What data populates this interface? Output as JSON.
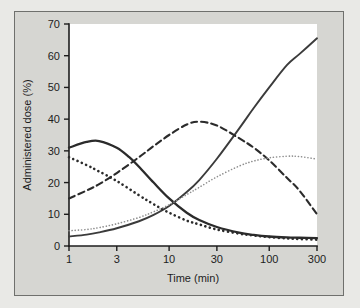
{
  "chart_data": {
    "type": "line",
    "title": "",
    "xlabel": "Time (min)",
    "ylabel": "Administered dose (%)",
    "xscale": "log",
    "xlim": [
      1,
      300
    ],
    "ylim": [
      0,
      70
    ],
    "grid": false,
    "legend": "none",
    "xticks": [
      "1",
      "3",
      "10",
      "30",
      "100",
      "300"
    ],
    "xtick_values": [
      1,
      3,
      10,
      30,
      100,
      300
    ],
    "yticks": [
      "0",
      "10",
      "20",
      "30",
      "40",
      "50",
      "60",
      "70"
    ],
    "ytick_values": [
      0,
      10,
      20,
      30,
      40,
      50,
      60,
      70
    ],
    "series": [
      {
        "name": "solid-rising",
        "style": "solid",
        "color": "#3b3b3b",
        "width": 1.9,
        "x": [
          1,
          1.5,
          2,
          3,
          5,
          7,
          10,
          15,
          20,
          30,
          50,
          70,
          100,
          150,
          200,
          300
        ],
        "values": [
          3.0,
          3.6,
          4.3,
          5.6,
          7.8,
          9.8,
          12.6,
          17.0,
          20.8,
          27.5,
          37.0,
          43.5,
          50.0,
          57.0,
          60.5,
          65.5
        ]
      },
      {
        "name": "solid-hump",
        "style": "solid",
        "color": "#2b2b2b",
        "width": 2.3,
        "x": [
          1,
          1.5,
          2,
          3,
          4,
          5,
          7,
          10,
          15,
          20,
          30,
          50,
          70,
          100,
          150,
          200,
          300
        ],
        "values": [
          31.0,
          32.8,
          33.1,
          31.0,
          28.0,
          25.0,
          20.0,
          15.0,
          10.5,
          8.2,
          6.0,
          4.2,
          3.5,
          3.0,
          2.7,
          2.6,
          2.5
        ]
      },
      {
        "name": "dashed-hump",
        "style": "dashed",
        "color": "#2b2b2b",
        "width": 2.1,
        "x": [
          1,
          1.5,
          2,
          3,
          5,
          7,
          10,
          15,
          20,
          30,
          50,
          70,
          100,
          150,
          200,
          300
        ],
        "values": [
          15.0,
          17.5,
          19.5,
          23.0,
          28.0,
          31.5,
          35.0,
          38.3,
          39.2,
          38.0,
          34.0,
          31.0,
          27.0,
          21.5,
          17.5,
          10.0
        ]
      },
      {
        "name": "thick-dotted-decay",
        "style": "dotted-thick",
        "color": "#2b2b2b",
        "width": 2.6,
        "x": [
          1,
          1.5,
          2,
          3,
          5,
          7,
          10,
          15,
          20,
          30,
          50,
          70,
          100,
          150,
          200,
          300
        ],
        "values": [
          28.0,
          25.5,
          23.5,
          20.5,
          16.0,
          13.2,
          10.5,
          8.0,
          6.8,
          5.2,
          3.9,
          3.3,
          2.8,
          2.4,
          2.2,
          2.0
        ]
      },
      {
        "name": "fine-dotted-rise",
        "style": "dotted-fine",
        "color": "#8e8e8e",
        "width": 1.6,
        "x": [
          1,
          1.5,
          2,
          3,
          5,
          7,
          10,
          15,
          20,
          30,
          50,
          70,
          100,
          150,
          200,
          300
        ],
        "values": [
          4.8,
          5.2,
          5.8,
          7.0,
          9.0,
          10.8,
          13.0,
          16.2,
          18.5,
          21.8,
          25.2,
          26.8,
          27.8,
          28.3,
          28.2,
          27.4
        ]
      }
    ]
  },
  "colors": {
    "page_background": "#e9e9e6",
    "panel_background": "#d6d6d2",
    "frame_border": "#6f706d",
    "plot_background": "#ffffff",
    "axis": "#1d1d1d"
  }
}
